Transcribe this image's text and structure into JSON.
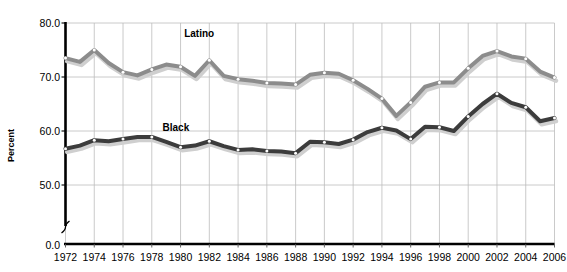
{
  "chart_data": {
    "type": "line",
    "title": "",
    "subtitle": "",
    "xlabel": "",
    "ylabel": "Percent",
    "ylim": [
      0.0,
      80.0
    ],
    "ytick_labels": [
      "0.0",
      "50.0",
      "60.0",
      "70.0",
      "80.0"
    ],
    "ytick_values": [
      0.0,
      50.0,
      60.0,
      70.0,
      80.0
    ],
    "y_axis_break": true,
    "grid": true,
    "grid_orientation": "both",
    "legend_position": "inline-annotation",
    "x": [
      1972,
      1973,
      1974,
      1975,
      1976,
      1977,
      1978,
      1979,
      1980,
      1981,
      1982,
      1983,
      1984,
      1985,
      1986,
      1987,
      1988,
      1989,
      1990,
      1991,
      1992,
      1993,
      1994,
      1995,
      1996,
      1997,
      1998,
      1999,
      2000,
      2001,
      2002,
      2003,
      2004,
      2005,
      2006
    ],
    "xtick_labels": [
      "1972",
      "1974",
      "1976",
      "1978",
      "1980",
      "1982",
      "1984",
      "1986",
      "1988",
      "1990",
      "1992",
      "1994",
      "1996",
      "1998",
      "2000",
      "2002",
      "2004",
      "2006"
    ],
    "xtick_values": [
      1972,
      1974,
      1976,
      1978,
      1980,
      1982,
      1984,
      1986,
      1988,
      1990,
      1992,
      1994,
      1996,
      1998,
      2000,
      2002,
      2004,
      2006
    ],
    "series": [
      {
        "name": "Latino",
        "color": "#8c8c8c",
        "values": [
          73.5,
          72.8,
          75.0,
          72.6,
          70.9,
          70.3,
          71.4,
          72.3,
          71.9,
          70.2,
          73.1,
          70.2,
          69.6,
          69.3,
          68.9,
          68.8,
          68.6,
          70.4,
          70.8,
          70.6,
          69.4,
          67.8,
          66.0,
          62.8,
          65.3,
          68.2,
          69.0,
          69.0,
          71.6,
          73.9,
          74.8,
          73.8,
          73.4,
          71.0,
          69.9
        ]
      },
      {
        "name": "Black",
        "color": "#3c3c3c",
        "values": [
          56.7,
          57.3,
          58.3,
          58.1,
          58.5,
          58.9,
          58.9,
          58.0,
          57.0,
          57.3,
          58.1,
          57.2,
          56.5,
          56.6,
          56.3,
          56.2,
          55.9,
          58.0,
          57.9,
          57.6,
          58.4,
          59.8,
          60.6,
          60.1,
          58.5,
          60.8,
          60.7,
          60.0,
          62.7,
          65.0,
          66.9,
          65.2,
          64.4,
          61.8,
          62.4
        ]
      }
    ],
    "annotations": [
      {
        "text": "Latino",
        "x": 1981.5,
        "y": 78.0
      },
      {
        "text": "Black",
        "x": 1980.0,
        "y": 60.5
      }
    ]
  }
}
